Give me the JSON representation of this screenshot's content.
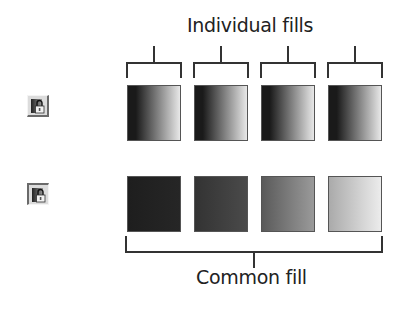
{
  "labels": {
    "individual": "Individual fills",
    "common": "Common fill"
  },
  "buttons": [
    {
      "name": "individual-fills-toggle",
      "state": "raised",
      "icon": "lock-gradient-icon"
    },
    {
      "name": "common-fill-toggle",
      "state": "pressed",
      "icon": "lock-gradient-icon"
    }
  ],
  "individual_fills": [
    {
      "from": "#1a1a1a",
      "to": "#e8e8e8"
    },
    {
      "from": "#1a1a1a",
      "to": "#e8e8e8"
    },
    {
      "from": "#1a1a1a",
      "to": "#e8e8e8"
    },
    {
      "from": "#1a1a1a",
      "to": "#e8e8e8"
    }
  ],
  "common_fill": [
    {
      "from": "#1e1e1e",
      "to": "#262626"
    },
    {
      "from": "#333333",
      "to": "#4a4a4a"
    },
    {
      "from": "#5a5a5a",
      "to": "#9a9a9a"
    },
    {
      "from": "#aaaaaa",
      "to": "#ececec"
    }
  ]
}
